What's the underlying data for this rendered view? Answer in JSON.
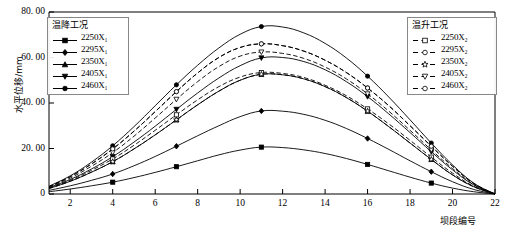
{
  "chart_data": {
    "type": "line",
    "title": "",
    "xlabel": "坝段编号",
    "ylabel": "水平位移/mm",
    "xlim": [
      1,
      22
    ],
    "ylim": [
      0,
      80
    ],
    "grid": false,
    "x": [
      1,
      2,
      3,
      4,
      5,
      6,
      7,
      8,
      9,
      10,
      11,
      12,
      13,
      14,
      15,
      16,
      17,
      18,
      19,
      20,
      21,
      22
    ],
    "xticks": [
      2,
      4,
      6,
      8,
      10,
      12,
      14,
      16,
      18,
      20,
      22
    ],
    "xticklabels": [
      "2",
      "4",
      "6",
      "8",
      "10",
      "12",
      "14",
      "16",
      "18",
      "20",
      "22"
    ],
    "yticks": [
      0,
      20,
      40,
      60,
      80
    ],
    "yticklabels": [
      "0",
      "20. 00",
      "40. 00",
      "60. 00",
      "80. 00"
    ],
    "series": [
      {
        "name": "2250X₁",
        "group": "温降工况",
        "style": "solid",
        "marker": "square-filled",
        "values": [
          1.0,
          2.2,
          3.6,
          5.2,
          7.2,
          9.5,
          12.0,
          14.6,
          17.2,
          19.3,
          20.6,
          20.4,
          19.4,
          17.8,
          15.6,
          13.0,
          10.2,
          7.4,
          4.8,
          2.6,
          1.0,
          0.0
        ]
      },
      {
        "name": "2295X₁",
        "group": "温降工况",
        "style": "solid",
        "marker": "diamond-filled",
        "values": [
          1.6,
          3.6,
          6.0,
          8.8,
          12.4,
          16.5,
          21.0,
          25.6,
          30.0,
          34.0,
          36.5,
          36.4,
          35.0,
          32.4,
          28.8,
          24.4,
          19.6,
          14.6,
          9.8,
          5.4,
          2.0,
          0.0
        ]
      },
      {
        "name": "2350X₁",
        "group": "温降工况",
        "style": "solid",
        "marker": "triangle-filled",
        "values": [
          2.4,
          5.6,
          9.6,
          14.2,
          19.8,
          26.0,
          32.6,
          39.2,
          45.2,
          50.0,
          52.6,
          52.4,
          50.6,
          47.2,
          42.4,
          36.4,
          29.6,
          22.4,
          15.2,
          8.4,
          3.2,
          0.0
        ]
      },
      {
        "name": "2405X₁",
        "group": "温降工况",
        "style": "solid",
        "marker": "triangle-down-filled",
        "values": [
          2.8,
          6.4,
          11.0,
          16.4,
          22.8,
          29.8,
          37.2,
          44.4,
          51.0,
          56.4,
          59.8,
          60.0,
          58.2,
          54.6,
          49.4,
          42.8,
          35.2,
          27.0,
          18.6,
          10.6,
          4.0,
          0.0
        ]
      },
      {
        "name": "2460X₁",
        "group": "温降工况",
        "style": "solid",
        "marker": "circle-filled",
        "values": [
          3.4,
          8.0,
          14.0,
          21.2,
          29.6,
          38.8,
          48.0,
          56.6,
          64.2,
          70.2,
          73.6,
          73.4,
          70.8,
          66.2,
          59.8,
          51.8,
          42.6,
          32.6,
          22.4,
          12.8,
          4.8,
          0.0
        ]
      },
      {
        "name": "2250X₂",
        "group": "温升工况",
        "style": "dashed",
        "marker": "square-open",
        "values": [
          2.6,
          6.0,
          10.4,
          15.4,
          21.4,
          28.0,
          34.8,
          41.4,
          47.2,
          51.4,
          53.4,
          53.0,
          51.2,
          47.8,
          43.2,
          37.4,
          30.8,
          23.6,
          16.2,
          9.2,
          3.4,
          0.0
        ]
      },
      {
        "name": "2295X₂",
        "group": "温升工况",
        "style": "dashed",
        "marker": "circle-open",
        "values": [
          3.2,
          7.6,
          13.2,
          19.8,
          27.6,
          36.2,
          45.0,
          53.2,
          60.0,
          64.4,
          66.0,
          65.2,
          62.8,
          58.8,
          53.4,
          46.6,
          38.8,
          30.0,
          21.0,
          12.2,
          4.6,
          0.0
        ]
      },
      {
        "name": "2350X₂",
        "group": "温升工况",
        "style": "dashed",
        "marker": "star-open",
        "values": [
          2.4,
          5.6,
          9.6,
          14.2,
          19.8,
          26.0,
          32.6,
          39.2,
          45.2,
          50.0,
          52.6,
          52.4,
          50.6,
          47.2,
          42.4,
          36.4,
          29.6,
          22.4,
          15.2,
          8.4,
          3.2,
          0.0
        ]
      },
      {
        "name": "2405X₂",
        "group": "温升工况",
        "style": "dashed",
        "marker": "triangle-down-open",
        "values": [
          3.0,
          7.0,
          12.2,
          18.2,
          25.4,
          33.4,
          41.6,
          49.4,
          56.0,
          60.6,
          62.4,
          61.8,
          59.6,
          55.8,
          50.6,
          44.0,
          36.4,
          28.0,
          19.4,
          11.2,
          4.2,
          0.0
        ]
      },
      {
        "name": "2460X₂",
        "group": "温升工况",
        "style": "dashed",
        "marker": "circle-open",
        "values": [
          3.2,
          7.6,
          13.2,
          19.8,
          27.6,
          36.2,
          45.0,
          53.2,
          60.0,
          64.4,
          66.0,
          65.2,
          62.8,
          58.8,
          53.4,
          46.6,
          38.8,
          30.0,
          21.0,
          12.2,
          4.6,
          0.0
        ]
      }
    ],
    "marker_x": [
      4,
      7,
      11,
      16,
      19
    ],
    "legends": [
      {
        "position": "top-left",
        "title": "温降工况",
        "entries": [
          "2250X₁",
          "2295X₁",
          "2350X₁",
          "2405X₁",
          "2460X₁"
        ]
      },
      {
        "position": "top-right",
        "title": "温升工况",
        "entries": [
          "2250X₂",
          "2295X₂",
          "2350X₂",
          "2405X₂",
          "2460X₂"
        ]
      }
    ],
    "colors": {
      "line": "#000000",
      "axis": "#000000",
      "legend_border": "#888888",
      "background": "#ffffff"
    }
  }
}
